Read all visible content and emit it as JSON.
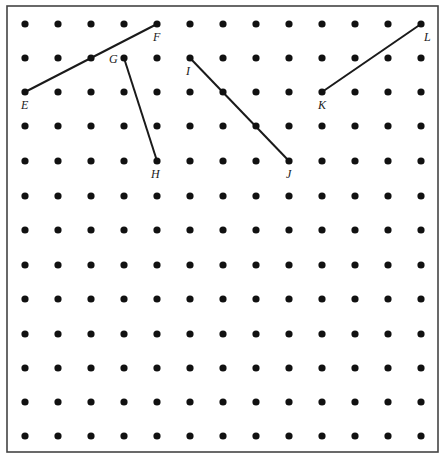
{
  "diagram": {
    "type": "geoboard-dot-grid",
    "grid": {
      "columns": 13,
      "rows": 13,
      "x_positions": [
        25,
        58,
        91,
        124,
        157,
        190,
        223,
        256,
        289,
        322,
        355,
        388,
        421
      ],
      "y_positions": [
        24,
        58,
        92,
        126,
        161,
        196,
        230,
        265,
        299,
        334,
        368,
        402,
        436
      ],
      "dot_radius": 3.6,
      "dot_color": "#111111"
    },
    "border": {
      "x": 7,
      "y": 6,
      "width": 431,
      "height": 446,
      "color": "#444444"
    },
    "segments": [
      {
        "name": "EF",
        "from": "E",
        "to": "F"
      },
      {
        "name": "GH",
        "from": "G",
        "to": "H"
      },
      {
        "name": "IJ",
        "from": "I",
        "to": "J"
      },
      {
        "name": "KL",
        "from": "K",
        "to": "L"
      }
    ],
    "points": {
      "E": {
        "col": 0,
        "row": 2,
        "label_dx": -4,
        "label_dy": 17
      },
      "F": {
        "col": 4,
        "row": 0,
        "label_dx": -4,
        "label_dy": 17
      },
      "G": {
        "col": 3,
        "row": 1,
        "label_dx": -15,
        "label_dy": 5
      },
      "H": {
        "col": 4,
        "row": 4,
        "label_dx": -6,
        "label_dy": 17
      },
      "I": {
        "col": 5,
        "row": 1,
        "label_dx": -4,
        "label_dy": 17
      },
      "J": {
        "col": 8,
        "row": 4,
        "label_dx": -3,
        "label_dy": 17
      },
      "K": {
        "col": 9,
        "row": 2,
        "label_dx": -4,
        "label_dy": 17
      },
      "L": {
        "col": 12,
        "row": 0,
        "label_dx": 3,
        "label_dy": 17
      }
    },
    "labels": [
      "E",
      "F",
      "G",
      "H",
      "I",
      "J",
      "K",
      "L"
    ],
    "line_color": "#1a1a1a"
  }
}
